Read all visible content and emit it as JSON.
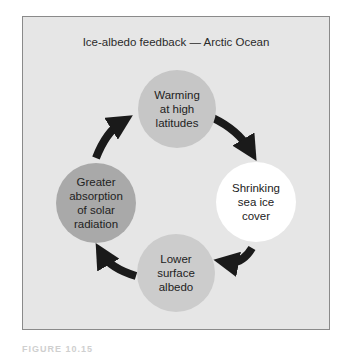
{
  "diagram": {
    "title": "Ice-albedo feedback — Arctic Ocean",
    "nodes": [
      {
        "id": "warming",
        "lines": [
          "Warming",
          "at high",
          "latitudes"
        ],
        "color": "#c6c6c6"
      },
      {
        "id": "shrinking",
        "lines": [
          "Shrinking",
          "sea ice",
          "cover"
        ],
        "color": "#ffffff"
      },
      {
        "id": "lower",
        "lines": [
          "Lower",
          "surface",
          "albedo"
        ],
        "color": "#cccccc"
      },
      {
        "id": "greater",
        "lines": [
          "Greater",
          "absorption",
          "of solar",
          "radiation"
        ],
        "color": "#a9a9a9"
      }
    ],
    "edges": [
      {
        "from": "warming",
        "to": "shrinking"
      },
      {
        "from": "shrinking",
        "to": "lower"
      },
      {
        "from": "lower",
        "to": "greater"
      },
      {
        "from": "greater",
        "to": "warming"
      }
    ],
    "frame_background": "#e6e6e6",
    "arrow_color": "#1a1a1a"
  },
  "caption": "FIGURE 10.15"
}
